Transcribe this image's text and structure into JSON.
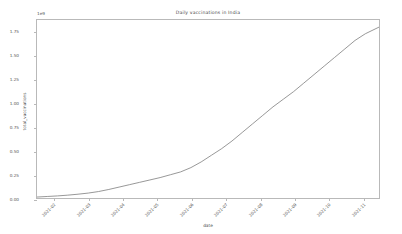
{
  "chart_data": {
    "type": "line",
    "title": "Daily vaccinations in India",
    "xlabel": "date",
    "ylabel": "total_vaccinations",
    "y_offset_label": "1e9",
    "grid": false,
    "legend": null,
    "line_color": "#7d7d7d",
    "background_color": "#ffffff",
    "frame_color": "#b9b9b9",
    "ylim": [
      0,
      1.875
    ],
    "yticks": [
      0.0,
      0.25,
      0.5,
      0.75,
      1.0,
      1.25,
      1.5,
      1.75
    ],
    "ytick_labels": [
      "0.00",
      "0.25",
      "0.50",
      "0.75",
      "1.00",
      "1.25",
      "1.50",
      "1.75"
    ],
    "xtick_labels": [
      "2021-02",
      "2021-03",
      "2021-04",
      "2021-05",
      "2021-06",
      "2021-07",
      "2021-08",
      "2021-09",
      "2021-10",
      "2021-11"
    ],
    "x": [
      0.0,
      0.03,
      0.06,
      0.09,
      0.12,
      0.15,
      0.18,
      0.21,
      0.24,
      0.27,
      0.3,
      0.33,
      0.36,
      0.39,
      0.42,
      0.45,
      0.48,
      0.51,
      0.54,
      0.57,
      0.6,
      0.63,
      0.66,
      0.69,
      0.72,
      0.75,
      0.78,
      0.81,
      0.84,
      0.87,
      0.9,
      0.93,
      0.96,
      1.0
    ],
    "values": [
      0.01,
      0.016,
      0.022,
      0.03,
      0.04,
      0.052,
      0.068,
      0.09,
      0.115,
      0.14,
      0.165,
      0.19,
      0.215,
      0.245,
      0.275,
      0.32,
      0.38,
      0.45,
      0.52,
      0.6,
      0.69,
      0.78,
      0.87,
      0.96,
      1.04,
      1.12,
      1.21,
      1.3,
      1.39,
      1.48,
      1.57,
      1.66,
      1.73,
      1.8
    ],
    "value_units": "vaccinations (billions)",
    "y_scale_factor": 1000000000
  }
}
